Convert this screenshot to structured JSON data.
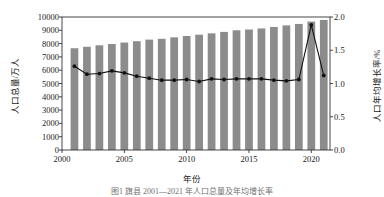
{
  "chart_data": {
    "type": "bar",
    "title": "",
    "caption": "图1  旗县 2001—2021 年人口总量及年均增长率",
    "xlabel": "年份",
    "ylabel": "人口总量/万人",
    "ylabel_right": "人口年均增长率/%",
    "grid": false,
    "legend_position": "none",
    "xlim": [
      2000,
      2021.5
    ],
    "ylim": [
      0,
      10000
    ],
    "ylim_right": [
      0.0,
      2.0
    ],
    "xticks": [
      "2000",
      "2005",
      "2010",
      "2015",
      "2020"
    ],
    "xtick_values": [
      2000,
      2005,
      2010,
      2015,
      2020
    ],
    "yticks_left": [
      "0",
      "1000",
      "2000",
      "3000",
      "4000",
      "5000",
      "6000",
      "7000",
      "8000",
      "9000",
      "10000"
    ],
    "ytick_values_left": [
      0,
      1000,
      2000,
      3000,
      4000,
      5000,
      6000,
      7000,
      8000,
      9000,
      10000
    ],
    "yticks_right": [
      "0.0",
      "0.5",
      "1.0",
      "1.5",
      "2.0"
    ],
    "ytick_values_right": [
      0.0,
      0.5,
      1.0,
      1.5,
      2.0
    ],
    "x": [
      2001,
      2002,
      2003,
      2004,
      2005,
      2006,
      2007,
      2008,
      2009,
      2010,
      2011,
      2012,
      2013,
      2014,
      2015,
      2016,
      2017,
      2018,
      2019,
      2020,
      2021
    ],
    "series": [
      {
        "name": "人口总量",
        "type": "bar",
        "axis": "left",
        "unit": "万人",
        "color": "#8c8c8c",
        "values": [
          7650,
          7760,
          7870,
          7970,
          8080,
          8180,
          8300,
          8360,
          8470,
          8570,
          8670,
          8770,
          8880,
          9000,
          9060,
          9140,
          9250,
          9370,
          9480,
          9660,
          9780
        ]
      },
      {
        "name": "人口年均增长率",
        "type": "line",
        "axis": "right",
        "unit": "%",
        "color": "#111111",
        "marker": "circle",
        "values": [
          1.26,
          1.14,
          1.15,
          1.19,
          1.16,
          1.11,
          1.08,
          1.05,
          1.05,
          1.06,
          1.03,
          1.07,
          1.06,
          1.07,
          1.07,
          1.07,
          1.05,
          1.04,
          1.06,
          1.88,
          1.12
        ]
      }
    ]
  },
  "axes": {
    "left_title": "人口总量/万人",
    "right_title": "人口年均增长率/%",
    "x_title": "年份"
  },
  "caption": {
    "text": "图1  旗县 2001—2021 年人口总量及年均增长率"
  }
}
